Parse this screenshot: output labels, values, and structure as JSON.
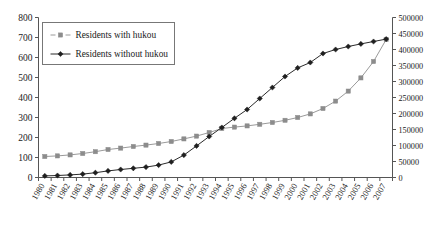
{
  "chart_data": {
    "type": "line",
    "title": "",
    "subtitle": "",
    "xlabel": "",
    "ylabel": "",
    "y2label": "",
    "grid": false,
    "legend_position": "top-left",
    "categories": [
      "1980",
      "1981",
      "1982",
      "1983",
      "1984",
      "1985",
      "1986",
      "1987",
      "1988",
      "1989",
      "1990",
      "1991",
      "1992",
      "1993",
      "1994",
      "1995",
      "1996",
      "1997",
      "1998",
      "1999",
      "2000",
      "2001",
      "2002",
      "2003",
      "2004",
      "2005",
      "2006",
      "2007"
    ],
    "ylim": [
      0,
      800
    ],
    "yticks": [
      "0",
      "100",
      "200",
      "300",
      "400",
      "500",
      "600",
      "700",
      "800"
    ],
    "y2lim": [
      0,
      500000
    ],
    "y2ticks": [
      "0",
      "50000",
      "100000",
      "150000",
      "200000",
      "250000",
      "300000",
      "350000",
      "400000",
      "450000",
      "500000"
    ],
    "series": [
      {
        "name": "Residents with hukou",
        "marker": "square",
        "color": "#8c8c8c",
        "axis": "left",
        "values": [
          105,
          108,
          113,
          120,
          129,
          140,
          147,
          155,
          162,
          170,
          180,
          193,
          207,
          225,
          245,
          252,
          258,
          266,
          275,
          286,
          300,
          318,
          345,
          382,
          432,
          498,
          580,
          690
        ]
      },
      {
        "name": "Residents without hukou",
        "marker": "diamond",
        "color": "#1f1f1f",
        "axis": "left",
        "values": [
          8,
          10,
          13,
          17,
          24,
          33,
          40,
          46,
          52,
          62,
          78,
          112,
          158,
          205,
          250,
          296,
          340,
          395,
          450,
          505,
          548,
          575,
          620,
          640,
          655,
          668,
          680,
          692
        ]
      }
    ]
  },
  "legend": {
    "items": [
      {
        "label": "Residents with hukou",
        "marker": "square",
        "color": "#8c8c8c"
      },
      {
        "label": "Residents without hukou",
        "marker": "diamond",
        "color": "#1f1f1f"
      }
    ]
  }
}
